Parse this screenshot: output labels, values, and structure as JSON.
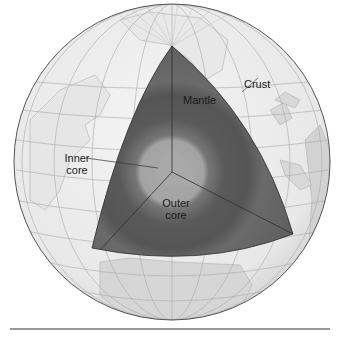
{
  "diagram": {
    "labels": {
      "crust": "Crust",
      "mantle": "Mantle",
      "inner_core_line1": "Inner",
      "inner_core_line2": "core",
      "outer_core_line1": "Outer",
      "outer_core_line2": "core"
    },
    "colors": {
      "ocean": "#ececec",
      "land": "#d6d6d6",
      "graticule": "#a8a8a8",
      "globe_outline": "#555555",
      "mantle": "#5e5e5e",
      "mantle_mid": "#6e6e6e",
      "outer_core": "#555555",
      "inner_core": "#a6a6a6",
      "cut_edge": "#2e2e2e"
    }
  }
}
